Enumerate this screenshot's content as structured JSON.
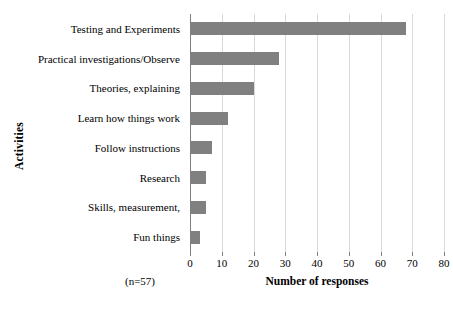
{
  "chart_data": {
    "type": "bar",
    "orientation": "horizontal",
    "title": "",
    "xlabel": "Number of responses",
    "ylabel": "Activities",
    "categories": [
      "Testing and Experiments",
      "Practical investigations/Observe",
      "Theories, explaining",
      "Learn how things work",
      "Follow instructions",
      "Research",
      "Skills, measurement,",
      "Fun things"
    ],
    "values": [
      68,
      28,
      20,
      12,
      7,
      5,
      5,
      3
    ],
    "xlim": [
      0,
      80
    ],
    "xticks": [
      0,
      10,
      20,
      30,
      40,
      50,
      60,
      70,
      80
    ],
    "xtick_labels": [
      "0",
      "10",
      "20",
      "30",
      "40",
      "50",
      "60",
      "70",
      "80"
    ],
    "grid": true,
    "legend": false,
    "annotations": [
      "(n=57)"
    ],
    "bar_color": "#808080",
    "gridline_color": "#d9d9d9",
    "axis_color": "#808080",
    "text_color": "#000000"
  },
  "annotation": {
    "sample_size": "(n=57)"
  }
}
